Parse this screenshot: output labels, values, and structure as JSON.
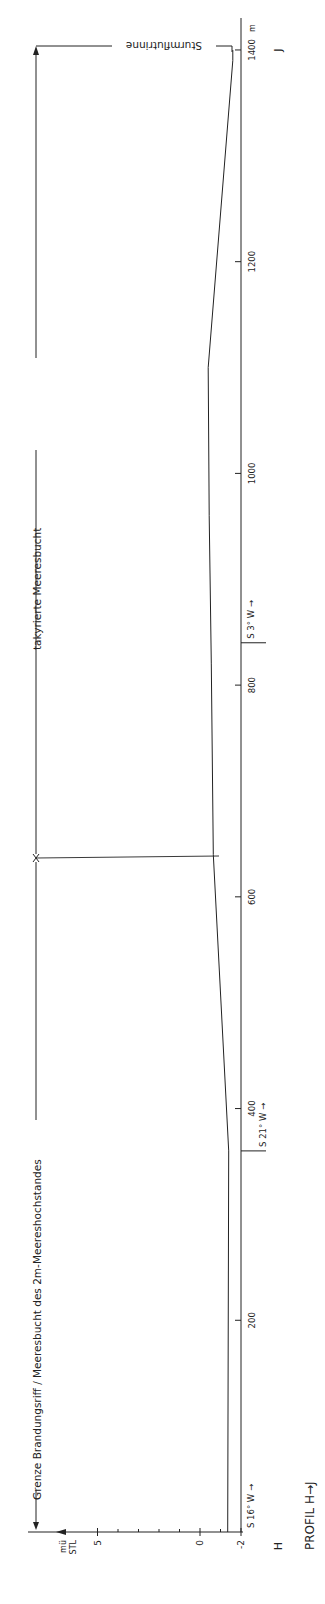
{
  "figure": {
    "title": "PROFIL  H→J",
    "start_label": "H",
    "end_label": "J",
    "colors": {
      "ink": "#222222",
      "background": "#ffffff"
    }
  },
  "distance_axis": {
    "unit": "m",
    "ticks": [
      {
        "value": 200,
        "label": "200"
      },
      {
        "value": 400,
        "label": "400"
      },
      {
        "value": 600,
        "label": "600"
      },
      {
        "value": 800,
        "label": "800"
      },
      {
        "value": 1000,
        "label": "1000"
      },
      {
        "value": 1200,
        "label": "1200"
      },
      {
        "value": 1400,
        "label": "1400"
      }
    ]
  },
  "elevation_axis": {
    "unit_line1": "mü",
    "unit_line2": "STL",
    "ticks": [
      {
        "value": 5,
        "label": "5"
      },
      {
        "value": 0,
        "label": "0"
      },
      {
        "value": -2,
        "label": "-2"
      }
    ],
    "minor_ticks": [
      4,
      3,
      2,
      1,
      -1
    ]
  },
  "bearings": [
    {
      "at_m": 0,
      "label": "S 16° W →"
    },
    {
      "at_m": 360,
      "label": "S 21° W →"
    },
    {
      "at_m": 840,
      "label": "S 3° W →"
    }
  ],
  "zones": [
    {
      "from_m": 0,
      "to_m": 640,
      "label": "Grenze Brandungsriff / Meeresbucht des 2m-Meereshochstandes"
    },
    {
      "from_m": 640,
      "to_m": 1400,
      "label": "takyrierte Meeresbucht"
    },
    {
      "at_m": 1400,
      "label": "Sturmflutrinne"
    }
  ],
  "profile": [
    {
      "d": 0,
      "e": -1.35
    },
    {
      "d": 360,
      "e": -1.4
    },
    {
      "d": 640,
      "e": -0.65
    },
    {
      "d": 820,
      "e": -0.55
    },
    {
      "d": 960,
      "e": -0.45
    },
    {
      "d": 1100,
      "e": -0.4
    },
    {
      "d": 1390,
      "e": -1.6
    },
    {
      "d": 1400,
      "e": -1.6
    }
  ]
}
